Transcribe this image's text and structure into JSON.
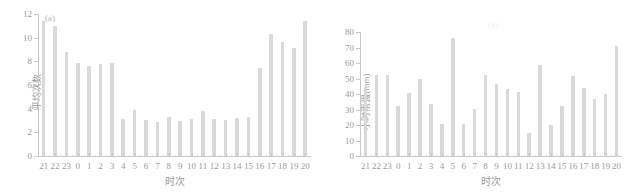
{
  "figure": {
    "background": "#ffffff",
    "bar_color": "#d9d9d9",
    "axis_color": "#c9c9c9",
    "text_color": "#9a9a9a"
  },
  "panels": [
    {
      "tag": "(a)",
      "tag_visible": true
    },
    {
      "tag": "(b)",
      "tag_visible": false
    }
  ],
  "chart_data": [
    {
      "type": "bar",
      "title": "(a)",
      "xlabel": "时次",
      "ylabel": "平均次数",
      "categories": [
        "21",
        "22",
        "23",
        "0",
        "1",
        "2",
        "3",
        "4",
        "5",
        "6",
        "7",
        "8",
        "9",
        "10",
        "11",
        "12",
        "13",
        "14",
        "15",
        "16",
        "17",
        "18",
        "19",
        "20"
      ],
      "values": [
        11.4,
        11.0,
        8.75,
        7.85,
        7.6,
        7.8,
        7.85,
        3.1,
        3.85,
        3.05,
        2.9,
        3.3,
        2.95,
        3.1,
        3.8,
        3.1,
        3.05,
        3.2,
        3.3,
        7.4,
        10.3,
        9.6,
        9.15,
        11.4
      ],
      "ylim": [
        0,
        12
      ],
      "yticks": [
        0,
        2,
        4,
        6,
        8,
        10,
        12
      ],
      "ytick_labels": [
        "0",
        "2",
        "4",
        "6",
        "8",
        "10",
        "12"
      ],
      "grid": false,
      "legend": false
    },
    {
      "type": "bar",
      "title": "(b)",
      "xlabel": "时次",
      "ylabel": "小时雨强(mm)",
      "categories": [
        "21",
        "22",
        "23",
        "0",
        "1",
        "2",
        "3",
        "4",
        "5",
        "6",
        "7",
        "8",
        "9",
        "10",
        "11",
        "12",
        "13",
        "14",
        "15",
        "16",
        "17",
        "18",
        "19",
        "20"
      ],
      "values": [
        44,
        52.5,
        52,
        32.5,
        40.5,
        49.5,
        33.5,
        20.5,
        76,
        20.5,
        30.5,
        52,
        46.5,
        43.5,
        41,
        15,
        58.5,
        20,
        32.5,
        51.5,
        44,
        37,
        40,
        71
      ],
      "ylim": [
        0,
        80
      ],
      "yticks": [
        0,
        10,
        20,
        30,
        40,
        50,
        60,
        70,
        80
      ],
      "ytick_labels": [
        "0",
        "10",
        "20",
        "30",
        "40",
        "50",
        "60",
        "70",
        "80"
      ],
      "grid": false,
      "legend": false
    }
  ]
}
